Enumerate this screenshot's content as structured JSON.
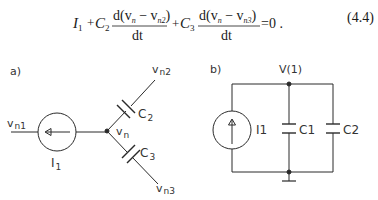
{
  "equation": {
    "terms": {
      "I": "I",
      "I_sub": "1",
      "plus1": "+",
      "C2": "C",
      "C2_sub": "2",
      "num1": "d(v",
      "num1_n": "n",
      "num1_mid": " − v",
      "num1_sub": "n2",
      "num1_close": ")",
      "den1": "dt",
      "plus2": "+",
      "C3": "C",
      "C3_sub": "3",
      "num2": "d(v",
      "num2_n": "n",
      "num2_mid": " − v",
      "num2_sub": "n3",
      "num2_close": ")",
      "den2": "dt",
      "rhs": "=0 ."
    },
    "number": "(4.4)"
  },
  "diagram_a": {
    "label": "a)",
    "vn1": "v",
    "vn1_sub": "n1",
    "vn2": "v",
    "vn2_sub": "n2",
    "vn3": "v",
    "vn3_sub": "n3",
    "vn": "v",
    "vn_sub": "n",
    "source": "I",
    "source_sub": "1",
    "c2": "C",
    "c2_sub": "2",
    "c3": "C",
    "c3_sub": "3"
  },
  "diagram_b": {
    "label": "b)",
    "node": "V(1)",
    "source": "I1",
    "c1": "C1",
    "c2": "C2"
  }
}
